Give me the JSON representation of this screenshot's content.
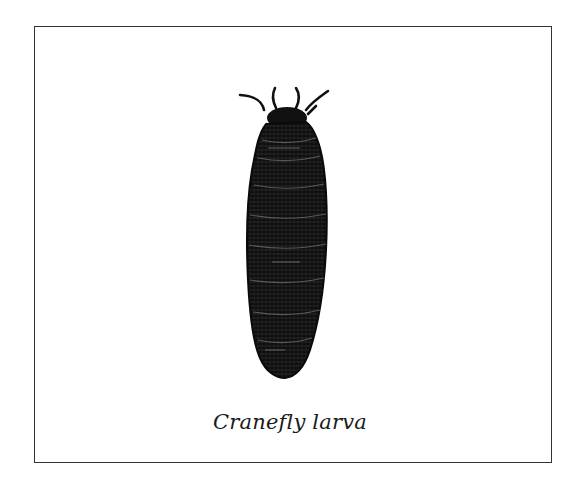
{
  "figure": {
    "caption": "Cranefly larva",
    "subject_icon": "cranefly-larva-illustration",
    "colors": {
      "ink": "#111111",
      "frame_border": "#333333",
      "background": "#ffffff"
    }
  }
}
